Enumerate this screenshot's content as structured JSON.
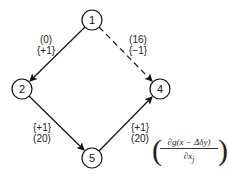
{
  "nodes": [
    {
      "id": "1",
      "label": "1",
      "x": 92,
      "y": 20
    },
    {
      "id": "2",
      "label": "2",
      "x": 22,
      "y": 89
    },
    {
      "id": "4",
      "label": "4",
      "x": 160,
      "y": 89
    },
    {
      "id": "5",
      "label": "5",
      "x": 92,
      "y": 158
    }
  ],
  "edges": [
    {
      "from": "1",
      "to": "2",
      "style": "solid",
      "label_top": "(0)",
      "label_bottom": "{+1}"
    },
    {
      "from": "1",
      "to": "4",
      "style": "dashed",
      "label_top": "(16)",
      "label_bottom": "{−1}"
    },
    {
      "from": "2",
      "to": "5",
      "style": "solid",
      "label_top": "{+1}",
      "label_bottom": "(20)"
    },
    {
      "from": "5",
      "to": "4",
      "style": "solid",
      "label_top": "{+1}",
      "label_bottom": "(20)"
    }
  ],
  "formula": {
    "open": "(",
    "numerator": "∂g(x − Δδy)",
    "denominator": "∂x",
    "denominator_sub": "j",
    "close": ")"
  }
}
